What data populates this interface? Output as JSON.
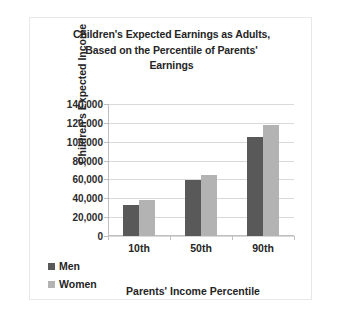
{
  "chart_data": {
    "type": "bar",
    "title": "Children's Expected Earnings as Adults, Based on the Percentile of Parents' Earnings",
    "title_lines": [
      "Children's Expected Earnings as Adults,",
      "Based on the Percentile of Parents'",
      "Earnings"
    ],
    "xlabel": "Parents' Income Percentile",
    "ylabel": "Children's Expected Income",
    "categories": [
      "10th",
      "50th",
      "90th"
    ],
    "series": [
      {
        "name": "Men",
        "values": [
          33000,
          59000,
          105000
        ],
        "color": "#595959"
      },
      {
        "name": "Women",
        "values": [
          38000,
          65000,
          118000
        ],
        "color": "#b3b3b3"
      }
    ],
    "ylim": [
      0,
      140000
    ],
    "ytick_step": 20000,
    "ytick_labels": [
      "140,000",
      "120,000",
      "100,000",
      "80,000",
      "60,000",
      "40,000",
      "20,000",
      "0"
    ],
    "ytick_values": [
      140000,
      120000,
      100000,
      80000,
      60000,
      40000,
      20000,
      0
    ],
    "grid": true,
    "legend_position": "left"
  }
}
